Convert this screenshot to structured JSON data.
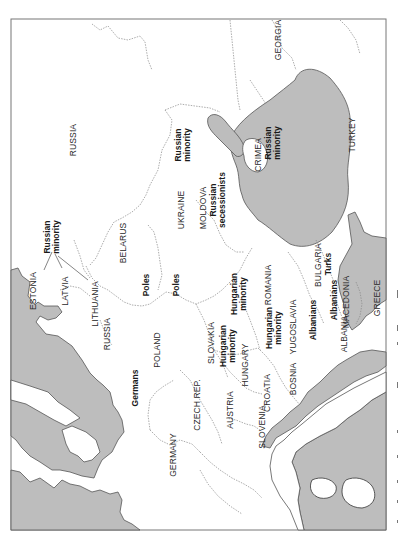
{
  "map": {
    "orientation": "rotated 90° counter-clockwise (north at left)",
    "colors": {
      "sea": "#bdbdbd",
      "land": "#ffffff",
      "border": "#888888",
      "frame": "#777777"
    },
    "countries": [
      {
        "id": "russia",
        "label": "RUSSIA",
        "x": 73,
        "y": 140
      },
      {
        "id": "georgia",
        "label": "GEORGIA",
        "x": 278,
        "y": 40
      },
      {
        "id": "turkey",
        "label": "TURKEY",
        "x": 352,
        "y": 135
      },
      {
        "id": "crimea",
        "label": "CRIMEA",
        "x": 258,
        "y": 155
      },
      {
        "id": "ukraine",
        "label": "UKRAINE",
        "x": 181,
        "y": 210
      },
      {
        "id": "moldova",
        "label": "MOLDOVA",
        "x": 203,
        "y": 208
      },
      {
        "id": "belarus",
        "label": "BELARUS",
        "x": 123,
        "y": 243
      },
      {
        "id": "estonia",
        "label": "ESTONIA",
        "x": 33,
        "y": 291
      },
      {
        "id": "latvia",
        "label": "LATVIA",
        "x": 65,
        "y": 291
      },
      {
        "id": "lithuania",
        "label": "LITHUANIA",
        "x": 95,
        "y": 304
      },
      {
        "id": "russia-kaliningrad",
        "label": "RUSSIA",
        "x": 107,
        "y": 334
      },
      {
        "id": "poland",
        "label": "POLAND",
        "x": 157,
        "y": 350
      },
      {
        "id": "romania",
        "label": "ROMANIA",
        "x": 268,
        "y": 285
      },
      {
        "id": "bulgaria",
        "label": "BULGARIA",
        "x": 318,
        "y": 265
      },
      {
        "id": "yugoslavia",
        "label": "YUGOSLAVIA",
        "x": 293,
        "y": 327
      },
      {
        "id": "slovakia",
        "label": "SLOVAKIA",
        "x": 211,
        "y": 343
      },
      {
        "id": "hungary",
        "label": "HUNGARY",
        "x": 245,
        "y": 365
      },
      {
        "id": "czech-rep",
        "label": "CZECH REP.",
        "x": 197,
        "y": 405
      },
      {
        "id": "austria",
        "label": "AUSTRIA",
        "x": 230,
        "y": 410
      },
      {
        "id": "croatia",
        "label": "CROATIA",
        "x": 267,
        "y": 393
      },
      {
        "id": "bosnia",
        "label": "BOSNIA",
        "x": 293,
        "y": 379
      },
      {
        "id": "slovenia",
        "label": "SLOVENIA",
        "x": 262,
        "y": 427
      },
      {
        "id": "germany",
        "label": "GERMANY",
        "x": 173,
        "y": 455
      },
      {
        "id": "macedonia",
        "label": "MACEDONIA",
        "x": 346,
        "y": 302
      },
      {
        "id": "albania",
        "label": "ALBANIA",
        "x": 344,
        "y": 334
      },
      {
        "id": "greece",
        "label": "GREECE",
        "x": 377,
        "y": 298
      }
    ],
    "minorities": [
      {
        "id": "russian-minority-ukraine",
        "lines": [
          "Russian",
          "minority"
        ],
        "x": 183,
        "y": 145
      },
      {
        "id": "russian-minority-crimea",
        "lines": [
          "Russian",
          "minority"
        ],
        "x": 273,
        "y": 143
      },
      {
        "id": "russian-secessionists",
        "lines": [
          "Russian",
          "secessionists"
        ],
        "x": 218,
        "y": 200
      },
      {
        "id": "russian-minority-baltic",
        "lines": [
          "Russian",
          "minority"
        ],
        "x": 52,
        "y": 237
      },
      {
        "id": "poles-belarus",
        "lines": [
          "Poles"
        ],
        "x": 146,
        "y": 285
      },
      {
        "id": "poles-ukraine",
        "lines": [
          "Poles"
        ],
        "x": 176,
        "y": 285
      },
      {
        "id": "hungarian-minority-romania",
        "lines": [
          "Hungarian",
          "minority"
        ],
        "x": 239,
        "y": 294
      },
      {
        "id": "hungarian-minority-yugoslavia",
        "lines": [
          "Hungarian",
          "minority"
        ],
        "x": 274,
        "y": 328
      },
      {
        "id": "hungarian-minority-slovakia",
        "lines": [
          "Hungarian",
          "minority"
        ],
        "x": 228,
        "y": 346
      },
      {
        "id": "albanians-yugoslavia",
        "lines": [
          "Albanians"
        ],
        "x": 313,
        "y": 320
      },
      {
        "id": "albanians-macedonia",
        "lines": [
          "Albanians"
        ],
        "x": 334,
        "y": 300
      },
      {
        "id": "turks-bulgaria",
        "lines": [
          "Turks"
        ],
        "x": 328,
        "y": 264
      },
      {
        "id": "germans-poland",
        "lines": [
          "Germans"
        ],
        "x": 135,
        "y": 388
      }
    ]
  }
}
